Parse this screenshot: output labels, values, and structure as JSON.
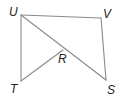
{
  "diagram": {
    "type": "geometry-figure",
    "points": {
      "U": {
        "label": "U",
        "x": 21,
        "y": 15,
        "label_x": 9,
        "label_y": 16
      },
      "V": {
        "label": "V",
        "x": 101,
        "y": 18,
        "label_x": 103,
        "label_y": 18
      },
      "T": {
        "label": "T",
        "x": 21,
        "y": 81,
        "label_x": 10,
        "label_y": 93
      },
      "S": {
        "label": "S",
        "x": 106,
        "y": 80,
        "label_x": 107,
        "label_y": 94
      },
      "R": {
        "label": "R",
        "x": 63,
        "y": 50,
        "label_x": 58,
        "label_y": 63
      }
    },
    "segments": [
      {
        "name": "UV",
        "from": "U",
        "to": "V"
      },
      {
        "name": "VS",
        "from": "V",
        "to": "S"
      },
      {
        "name": "UT",
        "from": "U",
        "to": "T"
      },
      {
        "name": "US",
        "from": "U",
        "to": "S"
      },
      {
        "name": "TR",
        "from": "T",
        "to": "R"
      }
    ],
    "colors": {
      "line": "#8a8a8a",
      "label": "#222222",
      "background": "#ffffff"
    }
  }
}
